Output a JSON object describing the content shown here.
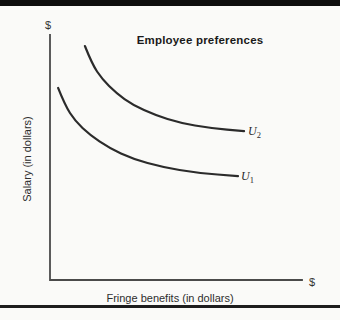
{
  "chart_data": {
    "type": "line",
    "title": "Employee preferences",
    "xlabel": "Fringe benefits (in dollars)",
    "ylabel": "Salary (in dollars)",
    "axis_unit_labels": {
      "y_axis_top": "$",
      "x_axis_end": "$"
    },
    "axes_numeric": false,
    "grid": false,
    "legend": "inline labels at right end of each curve",
    "series": [
      {
        "name": "U2",
        "label_base": "U",
        "label_sub": "2",
        "description": "upper indifference curve",
        "points": [
          [
            0.138,
            0.955
          ],
          [
            0.166,
            0.882
          ],
          [
            0.206,
            0.82
          ],
          [
            0.261,
            0.763
          ],
          [
            0.328,
            0.714
          ],
          [
            0.415,
            0.673
          ],
          [
            0.514,
            0.641
          ],
          [
            0.632,
            0.62
          ],
          [
            0.767,
            0.608
          ]
        ]
      },
      {
        "name": "U1",
        "label_base": "U",
        "label_sub": "1",
        "description": "lower indifference curve",
        "points": [
          [
            0.032,
            0.784
          ],
          [
            0.059,
            0.714
          ],
          [
            0.099,
            0.649
          ],
          [
            0.158,
            0.592
          ],
          [
            0.233,
            0.539
          ],
          [
            0.328,
            0.494
          ],
          [
            0.443,
            0.461
          ],
          [
            0.581,
            0.437
          ],
          [
            0.743,
            0.424
          ]
        ]
      }
    ]
  },
  "colors": {
    "top_bar": "#0e0e0e",
    "bottom_rule": "#1d1d1d",
    "axis": "#4a4a4a",
    "curve_ink": "#2b2b2b",
    "background": "#fafaf8"
  }
}
